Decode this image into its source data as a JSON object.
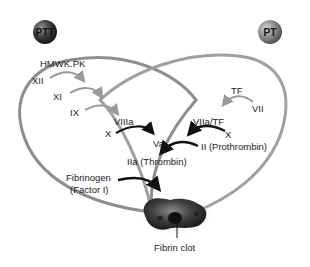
{
  "badges": {
    "left": "PTT",
    "right": "PT"
  },
  "intrinsic": {
    "factors": [
      "HMWK.PK",
      "XII",
      "XI",
      "IX",
      "VIIIa",
      "X"
    ]
  },
  "extrinsic": {
    "factors": [
      "TF",
      "VII",
      "VIIa/TF",
      "X"
    ]
  },
  "common": {
    "va": "Va",
    "prothrombin": "II (Prothrombin)",
    "thrombin": "IIa (Thrombin)",
    "fibrinogen_line1": "Fibrinogen",
    "fibrinogen_line2": "(Factor I)",
    "clot": "Fibrin clot"
  },
  "colors": {
    "left_ring": "#8a8a8a",
    "right_ring": "#9a9a9a",
    "arrow_light": "#9a9a9a",
    "arrow_dark": "#111111",
    "ball_left": "#4a4a4a",
    "ball_right": "#8c8c8c"
  }
}
